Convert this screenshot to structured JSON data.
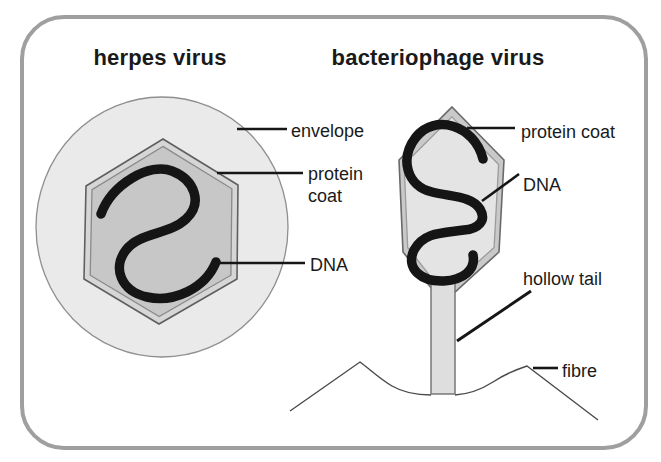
{
  "panel": {
    "border_color": "#9f9f9f",
    "background": "#ffffff"
  },
  "herpes": {
    "title": "herpes virus",
    "labels": {
      "envelope": "envelope",
      "protein_coat": "protein\ncoat",
      "dna": "DNA"
    },
    "colors": {
      "envelope_fill": "#eaeaea",
      "capsid_band": "#d6d6d6",
      "capsid_fill": "#c7c7c7",
      "dna": "#151515"
    }
  },
  "bacteriophage": {
    "title": "bacteriophage virus",
    "labels": {
      "protein_coat": "protein coat",
      "dna": "DNA",
      "hollow_tail": "hollow tail",
      "fibre": "fibre"
    },
    "colors": {
      "head_band": "#c9c9c9",
      "head_fill": "#e4e4e4",
      "tail_fill": "#dedede",
      "dna": "#151515",
      "fibre_line": "#4a4a4a"
    }
  }
}
